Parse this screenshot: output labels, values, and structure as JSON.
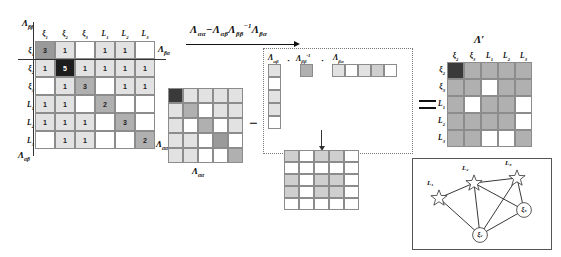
{
  "big_matrix": {
    "label_top_left": "Λββ",
    "label_top_right": "Λβα",
    "label_bottom_left": "Λαβ",
    "label_bottom_right": "Λαα",
    "col_headers": [
      "ξ₁",
      "ξ₂",
      "ξ₃",
      "L₁",
      "L₂",
      "L₃"
    ],
    "row_headers": [
      "ξ₁",
      "ξ₂",
      "ξ₃",
      "L₁",
      "L₂",
      "L₃"
    ],
    "rows": [
      [
        {
          "v": "3",
          "s": "s4"
        },
        {
          "v": "1",
          "s": "s1"
        },
        {
          "v": "",
          "s": "s0"
        },
        {
          "v": "1",
          "s": "s1"
        },
        {
          "v": "1",
          "s": "s1"
        },
        {
          "v": "",
          "s": "s0"
        }
      ],
      [
        {
          "v": "1",
          "s": "s1"
        },
        {
          "v": "5",
          "s": "s5"
        },
        {
          "v": "1",
          "s": "s1"
        },
        {
          "v": "1",
          "s": "s1"
        },
        {
          "v": "1",
          "s": "s1"
        },
        {
          "v": "1",
          "s": "s1"
        }
      ],
      [
        {
          "v": "",
          "s": "s0"
        },
        {
          "v": "1",
          "s": "s1"
        },
        {
          "v": "3",
          "s": "s3"
        },
        {
          "v": "",
          "s": "s0"
        },
        {
          "v": "1",
          "s": "s1"
        },
        {
          "v": "1",
          "s": "s1"
        }
      ],
      [
        {
          "v": "1",
          "s": "s1"
        },
        {
          "v": "1",
          "s": "s1"
        },
        {
          "v": "",
          "s": "s0"
        },
        {
          "v": "2",
          "s": "s3"
        },
        {
          "v": "",
          "s": "s0"
        },
        {
          "v": "",
          "s": "s0"
        }
      ],
      [
        {
          "v": "1",
          "s": "s1"
        },
        {
          "v": "1",
          "s": "s1"
        },
        {
          "v": "1",
          "s": "s1"
        },
        {
          "v": "",
          "s": "s0"
        },
        {
          "v": "3",
          "s": "s3"
        },
        {
          "v": "",
          "s": "s0"
        }
      ],
      [
        {
          "v": "",
          "s": "s0"
        },
        {
          "v": "1",
          "s": "s1"
        },
        {
          "v": "1",
          "s": "s1"
        },
        {
          "v": "",
          "s": "s0"
        },
        {
          "v": "",
          "s": "s0"
        },
        {
          "v": "2",
          "s": "s3"
        }
      ]
    ]
  },
  "formula": {
    "text": "Λαα − Λαβ Λββ⁻¹ Λβα"
  },
  "lambda_aa": {
    "label": "Λαα",
    "rows": [
      [
        "s6",
        "s1",
        "s1",
        "s1",
        "s1"
      ],
      [
        "s1",
        "s3",
        "s0",
        "s1",
        "s1"
      ],
      [
        "s1",
        "s0",
        "s3",
        "s0",
        "s1"
      ],
      [
        "s1",
        "s1",
        "s0",
        "s4",
        "s0"
      ],
      [
        "s1",
        "s1",
        "s0",
        "s0",
        "s3"
      ]
    ]
  },
  "factors": {
    "lambda_ab_label": "Λαβ",
    "lambda_bb_inv_label": "Λββ⁻¹",
    "lambda_ba_label": "Λβα",
    "dot1": "·",
    "dot2": "·",
    "lambda_ab_col": [
      "s1",
      "s0",
      "s1",
      "s1",
      "s0"
    ],
    "lambda_bb_inv": [
      "s3"
    ],
    "lambda_ba_row": [
      "s1",
      "s0",
      "s1",
      "s2",
      "s0"
    ]
  },
  "product_matrix": {
    "rows": [
      [
        "s2",
        "s0",
        "s2",
        "s2",
        "s0"
      ],
      [
        "s0",
        "s0",
        "s0",
        "s0",
        "s0"
      ],
      [
        "s2",
        "s0",
        "s2",
        "s2",
        "s0"
      ],
      [
        "s2",
        "s0",
        "s2",
        "s2",
        "s0"
      ],
      [
        "s0",
        "s0",
        "s0",
        "s0",
        "s0"
      ]
    ]
  },
  "lambda_prime": {
    "label": "Λ'",
    "col_headers": [
      "ξ₂",
      "ξ₃",
      "L₁",
      "L₂",
      "L₃"
    ],
    "row_headers": [
      "ξ₂",
      "ξ₃",
      "L₁",
      "L₂",
      "L₃"
    ],
    "rows": [
      [
        "s6",
        "s3",
        "s3",
        "s3",
        "s3"
      ],
      [
        "s3",
        "s3",
        "s0",
        "s3",
        "s3"
      ],
      [
        "s3",
        "s0",
        "s3",
        "s3",
        "s0"
      ],
      [
        "s3",
        "s3",
        "s3",
        "s3",
        "s0"
      ],
      [
        "s3",
        "s3",
        "s0",
        "s0",
        "s3"
      ]
    ]
  },
  "operators": {
    "minus": "−",
    "equals": "="
  },
  "graph": {
    "nodes": [
      {
        "id": "L1",
        "label": "L₁",
        "type": "star",
        "x": 27,
        "y": 40
      },
      {
        "id": "L2",
        "label": "L₂",
        "type": "star",
        "x": 62,
        "y": 25
      },
      {
        "id": "L3",
        "label": "L₃",
        "type": "star",
        "x": 105,
        "y": 20
      },
      {
        "id": "x3",
        "label": "ξ₃",
        "type": "circle",
        "x": 112,
        "y": 52
      },
      {
        "id": "x2",
        "label": "ξ₂",
        "type": "circle",
        "x": 68,
        "y": 77
      }
    ],
    "edges": [
      [
        "L1",
        "L2"
      ],
      [
        "L1",
        "x2"
      ],
      [
        "L2",
        "x2"
      ],
      [
        "L2",
        "x3"
      ],
      [
        "L3",
        "x2"
      ],
      [
        "L3",
        "x3"
      ],
      [
        "x2",
        "x3"
      ],
      [
        "L2",
        "L3"
      ]
    ]
  }
}
